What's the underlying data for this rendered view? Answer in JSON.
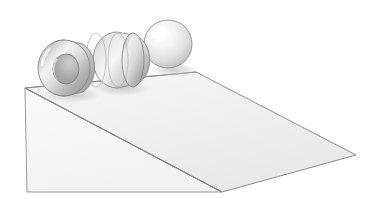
{
  "illustration": {
    "title": "Rolling objects on an inclined plane",
    "background_color": "#ffffff",
    "outline_color": "#8e8e90",
    "canvas": {
      "width": 382,
      "height": 199
    }
  },
  "incline": {
    "name": "inclined plane",
    "top_surface_label": "ramp top surface",
    "side_face_label": "ramp triangular side face",
    "top_surface_color": "#f2f2f2",
    "side_face_color": "#f7f7f7",
    "edge_color": "#909092",
    "vertices": {
      "ridge_left": [
        25,
        88
      ],
      "ridge_right": [
        196,
        72
      ],
      "far_right": [
        356,
        155
      ],
      "bottom_right": [
        222,
        192
      ],
      "bottom_left": [
        27,
        192
      ]
    }
  },
  "objects": [
    {
      "id": "hoop",
      "label": "hoop",
      "shape": "ring",
      "center": [
        64,
        68
      ],
      "outer_radius_x": 27,
      "outer_radius_y": 28,
      "inner_radius_x": 13,
      "inner_radius_y": 15,
      "body_color": "#d9d9d9",
      "highlight_color": "#fbfbfb",
      "shade_color": "#9a9a9a",
      "hole_color": "#b4b4b4"
    },
    {
      "id": "cylinder",
      "label": "cylinder",
      "shape": "disk",
      "center": [
        115,
        60
      ],
      "radius_x": 27,
      "radius_y": 28,
      "body_color": "#dedede",
      "highlight_color": "#fcfcfc",
      "shade_color": "#a6a6a6"
    },
    {
      "id": "sphere",
      "label": "sphere",
      "shape": "sphere",
      "center": [
        168,
        44
      ],
      "radius": 24,
      "body_color": "#ededed",
      "highlight_color": "#ffffff",
      "shade_color": "#b9b9b9"
    }
  ],
  "shadows": {
    "color": "#cfcfcf",
    "opacity": 0.55
  }
}
